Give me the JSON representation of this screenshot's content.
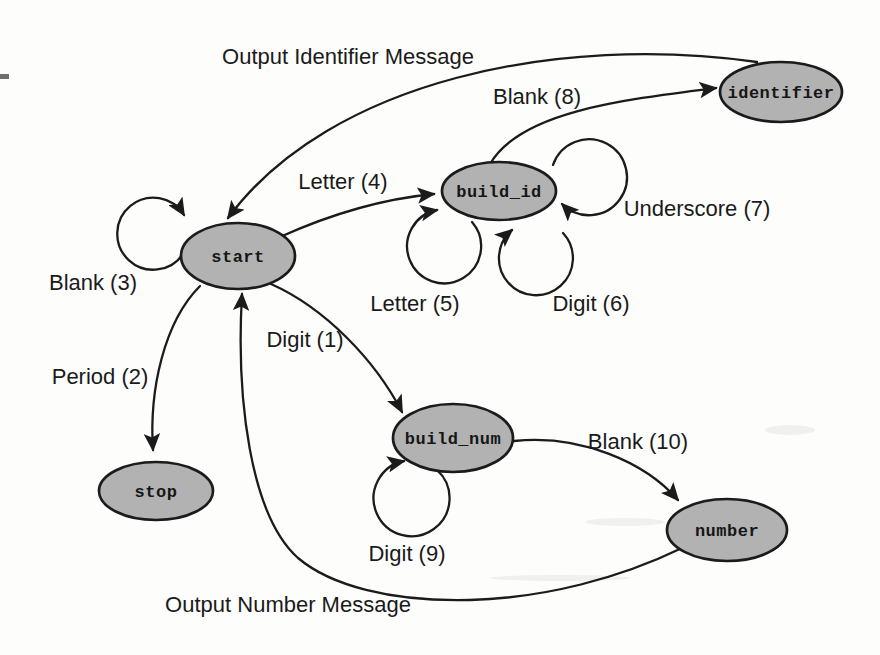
{
  "diagram": {
    "type": "finite-state-machine",
    "background": "#fdfdfc",
    "state_fill": "#b2b2b2",
    "state_stroke": "#1b1b1b",
    "line_color": "#1b1b1b",
    "states": [
      {
        "id": "start",
        "label": "start"
      },
      {
        "id": "build_id",
        "label": "build_id"
      },
      {
        "id": "identifier",
        "label": "identifier"
      },
      {
        "id": "build_num",
        "label": "build_num"
      },
      {
        "id": "number",
        "label": "number"
      },
      {
        "id": "stop",
        "label": "stop"
      }
    ],
    "transitions": [
      {
        "label": "Digit (1)",
        "from": "start",
        "to": "build_num"
      },
      {
        "label": "Period (2)",
        "from": "start",
        "to": "stop"
      },
      {
        "label": "Blank (3)",
        "from": "start",
        "to": "start"
      },
      {
        "label": "Letter (4)",
        "from": "start",
        "to": "build_id"
      },
      {
        "label": "Letter (5)",
        "from": "build_id",
        "to": "build_id"
      },
      {
        "label": "Digit (6)",
        "from": "build_id",
        "to": "build_id"
      },
      {
        "label": "Underscore (7)",
        "from": "build_id",
        "to": "build_id"
      },
      {
        "label": "Blank (8)",
        "from": "build_id",
        "to": "identifier"
      },
      {
        "label": "Digit (9)",
        "from": "build_num",
        "to": "build_num"
      },
      {
        "label": "Blank (10)",
        "from": "build_num",
        "to": "number"
      },
      {
        "label": "Output Identifier Message",
        "from": "identifier",
        "to": "start"
      },
      {
        "label": "Output Number Message",
        "from": "number",
        "to": "start"
      }
    ]
  }
}
